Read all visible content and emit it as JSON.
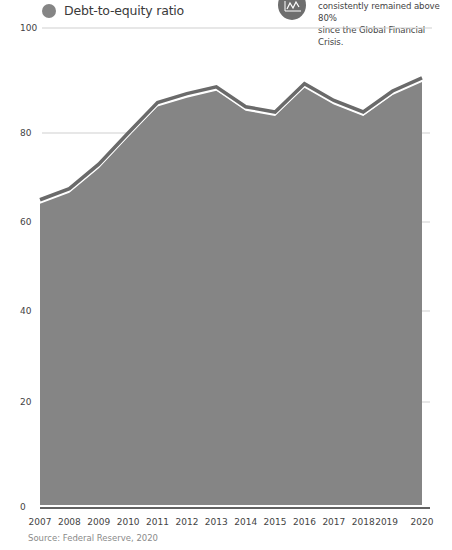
{
  "legend": {
    "label": "Debt-to-equity ratio",
    "color": "#858585"
  },
  "callout": {
    "icon": "line-chart-icon",
    "lines": [
      "consistently remained above 80%",
      "since the Global Financial Crisis."
    ]
  },
  "source": "Source: Federal Reserve, 2020",
  "colors": {
    "area_fill": "#858585",
    "area_stroke": "#6a6a6a",
    "gridline": "#cfcfcf",
    "baseline": "#2e2e2e"
  },
  "chart_data": {
    "type": "area",
    "title": "",
    "xlabel": "",
    "ylabel": "",
    "categories": [
      "2007",
      "2008",
      "2009",
      "2010",
      "2011",
      "2012",
      "2013",
      "2014",
      "2015",
      "2016",
      "2017",
      "2018",
      "2019",
      "2020"
    ],
    "series": [
      {
        "name": "Debt-to-equity ratio",
        "values": [
          65,
          67.5,
          73,
          80,
          85.8,
          87.5,
          88.8,
          85,
          84,
          89.4,
          86.2,
          84,
          88,
          90.5
        ]
      }
    ],
    "y_ticks": [
      0,
      20,
      40,
      60,
      80,
      100
    ],
    "ylim": [
      0,
      100
    ],
    "grid": true,
    "legend_position": "top-left",
    "annotation": "consistently remained above 80% since the Global Financial Crisis.",
    "source": "Source: Federal Reserve, 2020"
  }
}
